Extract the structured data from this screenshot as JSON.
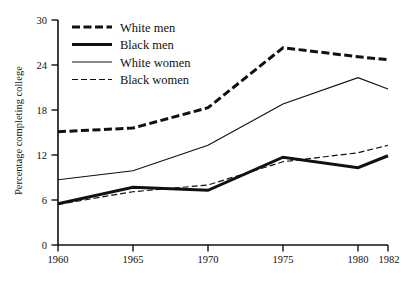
{
  "chart_data": {
    "type": "line",
    "title": "",
    "xlabel": "",
    "ylabel": "Percentage completing college",
    "x": [
      1960,
      1965,
      1970,
      1975,
      1980,
      1982
    ],
    "x_tick_labels": [
      "1960",
      "1965",
      "1970",
      "1975",
      "1980",
      "1982"
    ],
    "y_tick_labels": [
      "0",
      "6",
      "12",
      "18",
      "24",
      "30"
    ],
    "y_ticks": [
      0,
      6,
      12,
      18,
      24,
      30
    ],
    "ylim": [
      0,
      30
    ],
    "xlim": [
      1960,
      1982
    ],
    "grid": false,
    "legend_position": "top-left-inside",
    "series": [
      {
        "name": "White men",
        "style": "thick-dashed",
        "color": "#111111",
        "values": [
          15.1,
          15.6,
          18.3,
          26.3,
          25.1,
          24.7
        ]
      },
      {
        "name": "Black men",
        "style": "thick-solid",
        "color": "#111111",
        "values": [
          5.5,
          7.7,
          7.3,
          11.7,
          10.3,
          11.9
        ]
      },
      {
        "name": "White women",
        "style": "thin-solid",
        "color": "#111111",
        "values": [
          8.7,
          9.9,
          13.3,
          18.8,
          22.3,
          20.8
        ]
      },
      {
        "name": "Black women",
        "style": "thin-dashed",
        "color": "#111111",
        "values": [
          5.4,
          7.1,
          8.0,
          11.1,
          12.3,
          13.3
        ]
      }
    ]
  },
  "legend": {
    "entries": [
      {
        "label": "White men",
        "swatch": "swatch-thick-dashed"
      },
      {
        "label": "Black men",
        "swatch": "swatch-thick-solid"
      },
      {
        "label": "White women",
        "swatch": "swatch-thin-solid"
      },
      {
        "label": "Black women",
        "swatch": "swatch-thin-dashed"
      }
    ]
  },
  "axes": {
    "y_axis_title": "Percentage completing college",
    "y_tick_0": "0",
    "y_tick_6": "6",
    "y_tick_12": "12",
    "y_tick_18": "18",
    "y_tick_24": "24",
    "y_tick_30": "30",
    "x_tick_1960": "1960",
    "x_tick_1965": "1965",
    "x_tick_1970": "1970",
    "x_tick_1975": "1975",
    "x_tick_1980": "1980",
    "x_tick_1982": "1982"
  }
}
